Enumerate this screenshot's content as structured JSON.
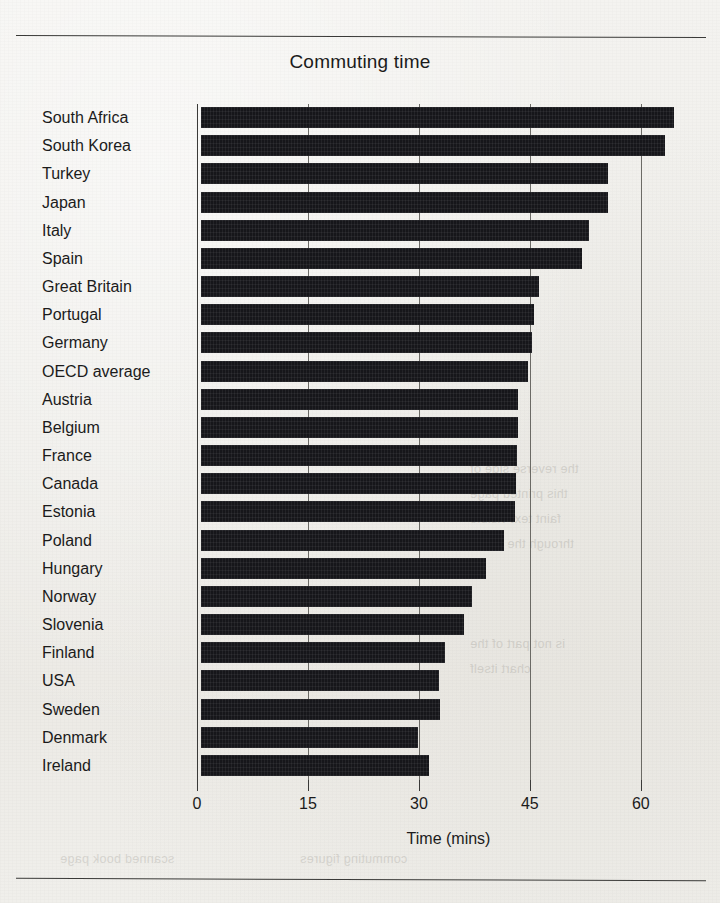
{
  "chart_data": {
    "type": "bar",
    "orientation": "horizontal",
    "title": "Commuting time",
    "xlabel": "Time (mins)",
    "ylabel": "",
    "xlim": [
      0,
      68
    ],
    "xticks": [
      0,
      15,
      30,
      45,
      60
    ],
    "xtick_labels": [
      "0",
      "15",
      "30",
      "45",
      "60"
    ],
    "grid": true,
    "gridlines_at": [
      0,
      15,
      30,
      45,
      60
    ],
    "legend": null,
    "bar_color": "#16161a",
    "categories": [
      "South Africa",
      "South Korea",
      "Turkey",
      "Japan",
      "Italy",
      "Spain",
      "Great Britain",
      "Portugal",
      "Germany",
      "OECD average",
      "Austria",
      "Belgium",
      "France",
      "Canada",
      "Estonia",
      "Poland",
      "Hungary",
      "Norway",
      "Slovenia",
      "Finland",
      "USA",
      "Sweden",
      "Denmark",
      "Ireland"
    ],
    "values": [
      64.0,
      62.7,
      55.0,
      55.0,
      52.5,
      51.5,
      45.7,
      45.0,
      44.7,
      44.2,
      42.8,
      42.8,
      42.7,
      42.6,
      42.5,
      41.0,
      38.5,
      36.7,
      35.5,
      33.0,
      32.2,
      32.3,
      29.3,
      30.8
    ]
  },
  "page": {
    "showthrough_lines": [
      "the reverse side of",
      "this printed page",
      "faint text visible",
      "through the paper",
      "is not part of the",
      "chart itself",
      "scanned book page",
      "commuting figures"
    ]
  }
}
